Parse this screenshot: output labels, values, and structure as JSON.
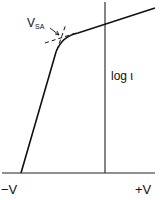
{
  "diagram": {
    "type": "current-voltage characteristic (log scale)",
    "labels": {
      "knee": "V",
      "knee_subscript": "SA",
      "y_axis": "log ι",
      "x_negative": "−V",
      "x_positive": "+V"
    },
    "colors": {
      "ink": "#111111",
      "background": "#ffffff"
    }
  }
}
